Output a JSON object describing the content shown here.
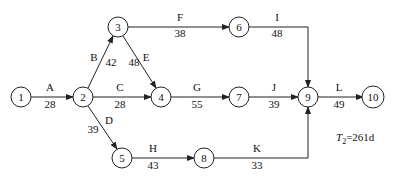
{
  "diagram": {
    "type": "activity-on-arrow network",
    "total_duration_label": "T",
    "total_duration_sub": "2",
    "total_duration_value": "=261d",
    "nodes": [
      {
        "id": "1",
        "x": 21,
        "y": 97
      },
      {
        "id": "2",
        "x": 83,
        "y": 97
      },
      {
        "id": "3",
        "x": 118,
        "y": 27
      },
      {
        "id": "4",
        "x": 161,
        "y": 97
      },
      {
        "id": "5",
        "x": 122,
        "y": 158
      },
      {
        "id": "6",
        "x": 239,
        "y": 27
      },
      {
        "id": "7",
        "x": 239,
        "y": 97
      },
      {
        "id": "8",
        "x": 204,
        "y": 158
      },
      {
        "id": "9",
        "x": 308,
        "y": 97
      },
      {
        "id": "10",
        "x": 373,
        "y": 97
      }
    ],
    "activities": [
      {
        "name": "A",
        "duration": "28",
        "from": "1",
        "to": "2"
      },
      {
        "name": "B",
        "duration": "42",
        "from": "2",
        "to": "3"
      },
      {
        "name": "C",
        "duration": "28",
        "from": "2",
        "to": "4"
      },
      {
        "name": "D",
        "duration": "39",
        "from": "2",
        "to": "5"
      },
      {
        "name": "E",
        "duration": "48",
        "from": "3",
        "to": "4"
      },
      {
        "name": "F",
        "duration": "38",
        "from": "3",
        "to": "6"
      },
      {
        "name": "G",
        "duration": "55",
        "from": "4",
        "to": "7"
      },
      {
        "name": "H",
        "duration": "43",
        "from": "5",
        "to": "8"
      },
      {
        "name": "I",
        "duration": "48",
        "from": "6",
        "to": "9"
      },
      {
        "name": "J",
        "duration": "39",
        "from": "7",
        "to": "9"
      },
      {
        "name": "K",
        "duration": "33",
        "from": "8",
        "to": "9"
      },
      {
        "name": "L",
        "duration": "49",
        "from": "9",
        "to": "10"
      }
    ]
  }
}
